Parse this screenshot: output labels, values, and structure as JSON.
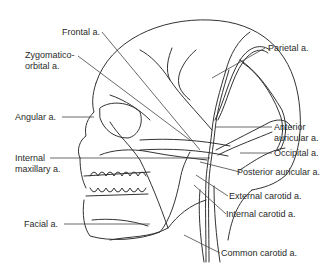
{
  "diagram": {
    "labels": {
      "frontal": "Frontal a.",
      "zygomatico_1": "Zygomatico-",
      "zygomatico_2": "orbital a.",
      "angular": "Angular a.",
      "internal_maxillary_1": "Internal",
      "internal_maxillary_2": "maxillary a.",
      "facial": "Facial a.",
      "parietal": "Parietal a.",
      "anterior_auricular_1": "Anterior",
      "anterior_auricular_2": "auricular a.",
      "occipital": "Occipital a.",
      "posterior_auricular": "Posterior auricular a.",
      "external_carotid": "External carotid a.",
      "internal_carotid": "Internal carotid a.",
      "common_carotid": "Common carotid a."
    },
    "line_color": "#333333"
  }
}
